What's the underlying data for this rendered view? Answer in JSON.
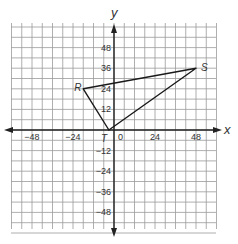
{
  "figure": {
    "type": "coordinate-plane",
    "axes": {
      "x_label": "x",
      "y_label": "y",
      "range": [
        -60,
        60
      ],
      "grid_step": 6,
      "x_ticks": [
        {
          "value": -48,
          "label": "−48"
        },
        {
          "value": -24,
          "label": "−24"
        },
        {
          "value": 0,
          "label": "0"
        },
        {
          "value": 24,
          "label": "24"
        },
        {
          "value": 48,
          "label": "48"
        }
      ],
      "y_ticks": [
        {
          "value": 48,
          "label": "48"
        },
        {
          "value": 36,
          "label": "36"
        },
        {
          "value": 24,
          "label": "24"
        },
        {
          "value": 12,
          "label": "12"
        },
        {
          "value": -12,
          "label": "−12"
        },
        {
          "value": -24,
          "label": "−24"
        },
        {
          "value": -36,
          "label": "−36"
        },
        {
          "value": -48,
          "label": "−48"
        }
      ]
    },
    "triangle": {
      "vertices": [
        {
          "name": "R",
          "x": -18,
          "y": 24
        },
        {
          "name": "S",
          "x": 48,
          "y": 36
        },
        {
          "name": "T",
          "x": -3,
          "y": 0
        }
      ]
    },
    "colors": {
      "grid": "#9a9a9a",
      "axis": "#222222",
      "shape": "#1a1a1a",
      "text": "#333333"
    }
  }
}
